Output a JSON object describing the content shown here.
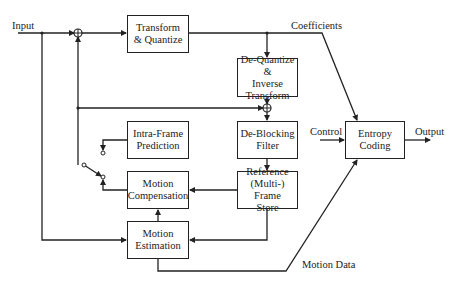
{
  "diagram": {
    "type": "block-diagram",
    "title": "",
    "blocks": {
      "transform": "Transform\n& Quantize",
      "dequantize": "De-Quantize &\nInverse\nTransform",
      "deblocking": "De-Blocking\nFilter",
      "reference": "Reference\n(Multi-) Frame\nStore",
      "intra": "Intra-Frame\nPrediction",
      "motion_comp": "Motion\nCompensation",
      "motion_est": "Motion\nEstimation",
      "entropy": "Entropy\nCoding"
    },
    "labels": {
      "input": "Input",
      "coefficients": "Coefficients",
      "control": "Control",
      "output": "Output",
      "motion_data": "Motion Data"
    },
    "edges": [
      {
        "from": "Input",
        "to": "sum-1"
      },
      {
        "from": "sum-1",
        "to": "Transform & Quantize"
      },
      {
        "from": "Transform & Quantize",
        "to": "De-Quantize & Inverse Transform",
        "label": "Coefficients"
      },
      {
        "from": "Transform & Quantize",
        "to": "Entropy Coding",
        "label": "Coefficients"
      },
      {
        "from": "De-Quantize & Inverse Transform",
        "to": "sum-2"
      },
      {
        "from": "sum-2",
        "to": "De-Blocking Filter"
      },
      {
        "from": "De-Blocking Filter",
        "to": "Reference (Multi-) Frame Store"
      },
      {
        "from": "Reference (Multi-) Frame Store",
        "to": "Motion Compensation"
      },
      {
        "from": "Reference (Multi-) Frame Store",
        "to": "Motion Estimation"
      },
      {
        "from": "Input",
        "to": "Motion Estimation"
      },
      {
        "from": "Motion Estimation",
        "to": "Motion Compensation"
      },
      {
        "from": "Motion Estimation",
        "to": "Entropy Coding",
        "label": "Motion Data"
      },
      {
        "from": "Intra-Frame Prediction",
        "to": "switch"
      },
      {
        "from": "Motion Compensation",
        "to": "switch"
      },
      {
        "from": "switch",
        "to": "sum-1"
      },
      {
        "from": "switch",
        "to": "sum-2"
      },
      {
        "from": "Control",
        "to": "Entropy Coding"
      },
      {
        "from": "Entropy Coding",
        "to": "Output"
      }
    ]
  }
}
